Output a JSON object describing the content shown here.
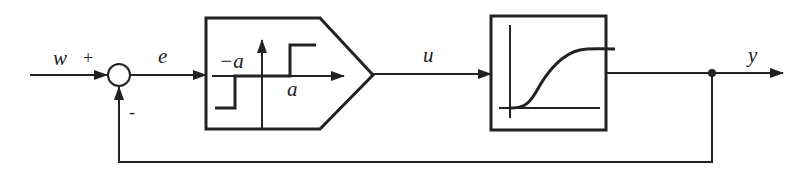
{
  "diagram": {
    "type": "closed-loop control block diagram",
    "signals": {
      "reference": "w",
      "error": "e",
      "control": "u",
      "output": "y"
    },
    "summing_junction": {
      "plus_sign": "+",
      "minus_sign": "-"
    },
    "controller": {
      "kind": "relay with dead zone (three-position element)",
      "neg_threshold_label": "−a",
      "pos_threshold_label": "a"
    },
    "plant": {
      "kind": "S-shaped step response (delay / higher-order lag)"
    },
    "feedback": "negative unity feedback from y to summing junction",
    "colors": {
      "stroke": "#222222",
      "background": "#ffffff"
    }
  }
}
